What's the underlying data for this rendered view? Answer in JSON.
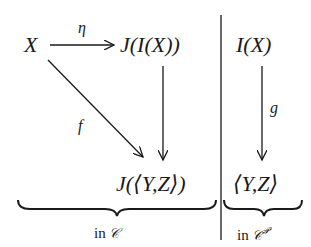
{
  "diagram": {
    "nodes": {
      "x": "X",
      "jix": "J(I(X))",
      "ix": "I(X)",
      "jyz": "J(⟨Y,Z⟩)",
      "yz": "⟨Y,Z⟩"
    },
    "arrows": {
      "eta": {
        "label": "η",
        "from": "X",
        "to": "J(I(X))"
      },
      "f": {
        "label": "f",
        "from": "X",
        "to": "J(⟨Y,Z⟩)"
      },
      "j_map": {
        "label": "",
        "from": "J(I(X))",
        "to": "J(⟨Y,Z⟩)"
      },
      "g": {
        "label": "g",
        "from": "I(X)",
        "to": "⟨Y,Z⟩"
      }
    },
    "braces": {
      "left": {
        "prefix": "in ",
        "category": "𝒞",
        "superscript": ""
      },
      "right": {
        "prefix": "in ",
        "category": "𝒞",
        "superscript": "𝒫"
      }
    },
    "colors": {
      "ink": "#1a1a1a",
      "background": "#ffffff"
    }
  }
}
